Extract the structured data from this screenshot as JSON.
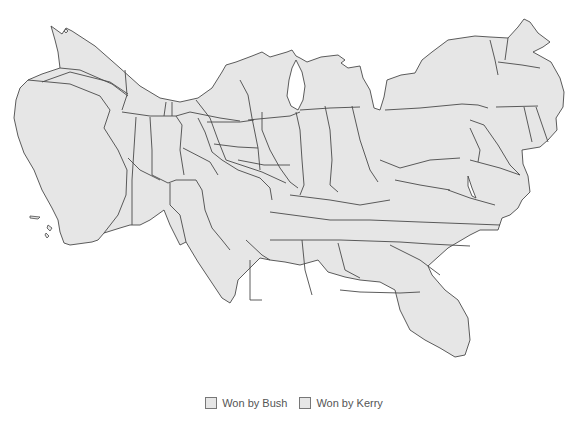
{
  "figure": {
    "type": "cartogram",
    "fill_color": "#e6e6e6",
    "stroke_color": "#4a4a4a",
    "background": "#ffffff"
  },
  "legend": {
    "items": [
      {
        "label": "Won by Bush",
        "color": "#e6e6e6"
      },
      {
        "label": "Won by Kerry",
        "color": "#e6e6e6"
      }
    ]
  }
}
